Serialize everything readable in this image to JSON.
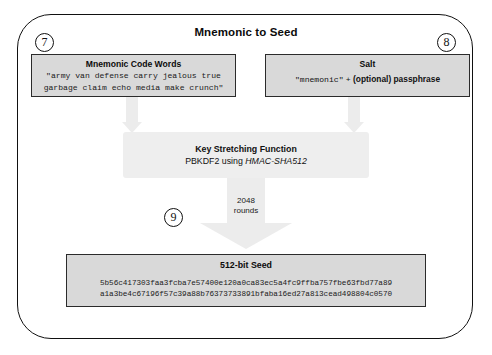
{
  "diagram": {
    "title": "Mnemonic to Seed",
    "steps": {
      "seven": "⑦",
      "eight": "⑧",
      "nine": "⑨"
    },
    "step_labels": {
      "seven": "7",
      "eight": "8",
      "nine": "9"
    },
    "mnemonic": {
      "title": "Mnemonic Code Words",
      "line1": "\"army van defense carry jealous true",
      "line2": "garbage claim echo media make crunch\""
    },
    "salt": {
      "title": "Salt",
      "quoted": "\"mnemonic\"",
      "plus": "+",
      "suffix": "(optional) passphrase"
    },
    "kdf": {
      "title": "Key Stretching Function",
      "subtitle_prefix": "PBKDF2 using ",
      "subtitle_algorithm": "HMAC-SHA512"
    },
    "rounds": {
      "count": "2048",
      "unit": "rounds"
    },
    "seed": {
      "title": "512-bit Seed",
      "hex_line1": "5b56c417303faa3fcba7e57400e120a0ca83ec5a4fc9ffba757fbe63fbd77a89",
      "hex_line2": "a1a3be4c67196f57c39a88b76373733891bfaba16ed27a813cead498804c0570"
    },
    "colors": {
      "box_fill": "#d9d9d9",
      "box_border": "#2b2b2b",
      "kdf_fill": "#eeeeee",
      "arrow_fill": "#ececec",
      "frame_stroke": "#111111",
      "text": "#111111"
    }
  }
}
